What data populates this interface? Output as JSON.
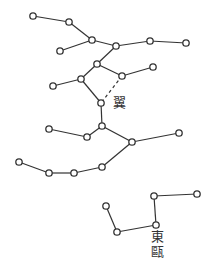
{
  "colors": {
    "ink": "#333333",
    "background": "#ffffff",
    "star_fill": "#ffffff"
  },
  "labels": [
    {
      "id": "yi",
      "text": "翼",
      "x": 113,
      "y": 96
    },
    {
      "id": "dongou-1",
      "text": "東",
      "x": 151,
      "y": 230
    },
    {
      "id": "dongou-2",
      "text": "甌",
      "x": 151,
      "y": 245
    }
  ],
  "stars": [
    [
      33,
      16
    ],
    [
      69,
      22
    ],
    [
      92,
      40
    ],
    [
      116,
      46
    ],
    [
      150,
      41
    ],
    [
      186,
      43
    ],
    [
      60,
      51
    ],
    [
      97,
      64
    ],
    [
      81,
      79
    ],
    [
      53,
      86
    ],
    [
      122,
      76
    ],
    [
      153,
      67
    ],
    [
      101,
      103
    ],
    [
      102,
      126
    ],
    [
      87,
      137
    ],
    [
      49,
      129
    ],
    [
      132,
      142
    ],
    [
      179,
      133
    ],
    [
      102,
      167
    ],
    [
      74,
      173
    ],
    [
      49,
      173
    ],
    [
      19,
      162
    ],
    [
      154,
      196
    ],
    [
      197,
      194
    ],
    [
      156,
      225
    ],
    [
      117,
      232
    ],
    [
      106,
      206
    ]
  ],
  "lines": [
    [
      0,
      1
    ],
    [
      1,
      2
    ],
    [
      2,
      3
    ],
    [
      3,
      4
    ],
    [
      4,
      5
    ],
    [
      2,
      6
    ],
    [
      3,
      7
    ],
    [
      7,
      8
    ],
    [
      8,
      9
    ],
    [
      7,
      10
    ],
    [
      10,
      11
    ],
    [
      8,
      12
    ],
    [
      12,
      13
    ],
    [
      13,
      14
    ],
    [
      14,
      15
    ],
    [
      13,
      16
    ],
    [
      16,
      17
    ],
    [
      16,
      18
    ],
    [
      18,
      19
    ],
    [
      19,
      20
    ],
    [
      20,
      21
    ],
    [
      22,
      23
    ],
    [
      22,
      24
    ],
    [
      24,
      25
    ],
    [
      25,
      26
    ]
  ],
  "dashed_lines": [
    [
      10,
      12
    ]
  ]
}
